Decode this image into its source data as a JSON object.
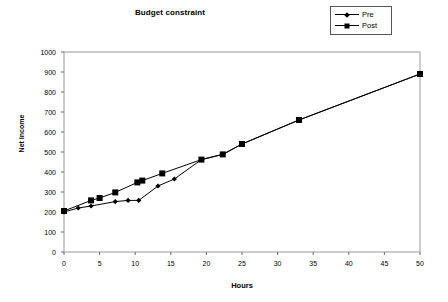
{
  "chart_data": {
    "type": "line",
    "title": "Budget constraint",
    "xlabel": "Hours",
    "ylabel": "Net income",
    "xlim": [
      0,
      50
    ],
    "ylim": [
      0,
      1000
    ],
    "xticks": [
      0,
      5,
      10,
      15,
      20,
      25,
      30,
      35,
      40,
      45,
      50
    ],
    "yticks": [
      0,
      100,
      200,
      300,
      400,
      500,
      600,
      700,
      800,
      900,
      1000
    ],
    "grid": false,
    "legend_position": "top-right",
    "series": [
      {
        "name": "Pre",
        "marker": "diamond",
        "color": "#000000",
        "points": [
          [
            0,
            200
          ],
          [
            2,
            220
          ],
          [
            3.8,
            230
          ],
          [
            7.2,
            252
          ],
          [
            9,
            258
          ],
          [
            10.5,
            258
          ],
          [
            13.2,
            330
          ],
          [
            15.5,
            365
          ],
          [
            19.3,
            462
          ],
          [
            22.3,
            488
          ],
          [
            25,
            540
          ],
          [
            33,
            660
          ],
          [
            50,
            890
          ]
        ]
      },
      {
        "name": "Post",
        "marker": "square",
        "color": "#000000",
        "points": [
          [
            0,
            205
          ],
          [
            3.8,
            258
          ],
          [
            5,
            270
          ],
          [
            7.2,
            298
          ],
          [
            10.3,
            348
          ],
          [
            11,
            357
          ],
          [
            13.8,
            393
          ],
          [
            19.3,
            462
          ],
          [
            22.3,
            488
          ],
          [
            25,
            540
          ],
          [
            33,
            660
          ],
          [
            50,
            890
          ]
        ]
      }
    ]
  },
  "legend": {
    "entries": [
      {
        "label": "Pre",
        "marker": "diamond"
      },
      {
        "label": "Post",
        "marker": "square"
      }
    ]
  }
}
